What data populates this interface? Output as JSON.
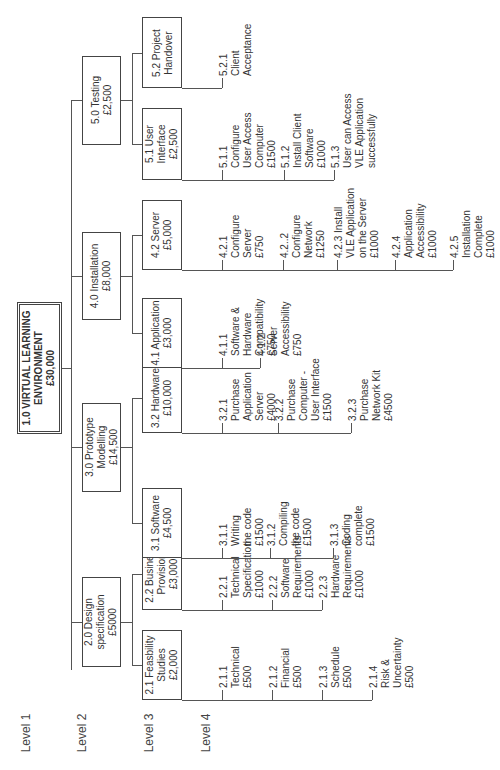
{
  "levels": [
    "Level  1",
    "Level 2",
    "Level 3",
    "Level 4"
  ],
  "root": {
    "lines": [
      "1.0  VIRTUAL LEARNING",
      "ENVIRONMENT",
      "£30,000"
    ]
  },
  "level2": [
    {
      "id": "2.0",
      "lines": [
        "2.0 Design",
        "specification",
        "£5000"
      ]
    },
    {
      "id": "3.0",
      "lines": [
        "3.0 Prototype",
        "Modelling",
        "£14,500"
      ]
    },
    {
      "id": "4.0",
      "lines": [
        "4.0 Installation",
        "£8,000"
      ]
    },
    {
      "id": "5.0",
      "lines": [
        "5.0 Testing",
        "£2,500"
      ]
    }
  ],
  "level3": [
    {
      "id": "2.1",
      "lines": [
        "2.1 Feasbility",
        "Studies",
        "£2,000"
      ]
    },
    {
      "id": "2.2",
      "lines": [
        "2.2 Business",
        "Provision",
        "£3,000"
      ]
    },
    {
      "id": "3.1",
      "lines": [
        "3.1 Software",
        "£4,500"
      ]
    },
    {
      "id": "3.2",
      "lines": [
        "3.2 Hardware",
        "£10,000"
      ]
    },
    {
      "id": "4.1",
      "lines": [
        "4.1 Application",
        "£3,000"
      ]
    },
    {
      "id": "4.2",
      "lines": [
        "4.2 Server",
        "£5,000"
      ]
    },
    {
      "id": "5.1",
      "lines": [
        "5.1 User",
        "Interface",
        "£2,500"
      ]
    },
    {
      "id": "5.2",
      "lines": [
        "5.2 Project",
        "Handover"
      ]
    }
  ],
  "level4": {
    "2.1": [
      {
        "lines": [
          "2.1.1",
          "Technical",
          "£500"
        ]
      },
      {
        "lines": [
          "2.1.2",
          "Financial",
          "£500"
        ]
      },
      {
        "lines": [
          "2.1.3",
          "Schedule",
          "£500"
        ]
      },
      {
        "lines": [
          "2.1.4",
          "Risk &",
          "Uncertainty",
          "£500"
        ]
      }
    ],
    "2.2": [
      {
        "lines": [
          "2.2.1",
          "Technical",
          "Specification",
          "£1000"
        ]
      },
      {
        "lines": [
          "2.2.2",
          "Software",
          "Requirements",
          "£1000"
        ]
      },
      {
        "lines": [
          "2.2.3",
          "Hardware",
          "Requirements",
          "£1000"
        ]
      }
    ],
    "3.1": [
      {
        "lines": [
          "3.1.1",
          "Writing",
          "the code",
          "£1500"
        ]
      },
      {
        "lines": [
          "3.1.2",
          "Compiling",
          "the code",
          "£1500"
        ]
      },
      {
        "lines": [
          "3.1.3",
          "Coding",
          "complete",
          "£1500"
        ]
      }
    ],
    "3.2": [
      {
        "lines": [
          "3.2.1",
          "Purchase",
          "Application",
          "Server",
          "£4000"
        ]
      },
      {
        "lines": [
          "3.2.2",
          "Purchase",
          "Computer -",
          "User Interface",
          "£1500"
        ]
      },
      {
        "lines": [
          "3.2.3",
          "Purchase",
          "Network Kit",
          "£4500"
        ]
      }
    ],
    "4.1": [
      {
        "lines": [
          "4.1.1",
          "Software &",
          "Hardware",
          "Compatibility",
          "£750"
        ]
      },
      {
        "lines": [
          "4.1.2",
          "Server",
          "Accessibility",
          "£750"
        ]
      }
    ],
    "4.2": [
      {
        "lines": [
          "4.2.1",
          "Configure",
          "Server",
          "£750"
        ]
      },
      {
        "lines": [
          "4.2..2",
          "Configure",
          "Network",
          "£1250"
        ]
      },
      {
        "lines": [
          "4.2.3 Install",
          "VLE Application",
          "on the Server",
          "£1000"
        ]
      },
      {
        "lines": [
          "4.2.4",
          "Application",
          "Accessibility",
          "£1000"
        ]
      },
      {
        "lines": [
          "4.2.5",
          "Installation",
          "Complete",
          "£1000"
        ]
      }
    ],
    "5.1": [
      {
        "lines": [
          "5.1.1",
          "Configure",
          "User Access",
          "Computer",
          "£1500"
        ]
      },
      {
        "lines": [
          "5.1.2",
          "Install Client",
          "Software",
          "£1000"
        ]
      },
      {
        "lines": [
          "5.1.3",
          "User can Access",
          "VLE Application",
          "successfully"
        ]
      }
    ],
    "5.2": [
      {
        "lines": [
          "5.2.1",
          "Client",
          "Acceptance"
        ]
      }
    ]
  }
}
